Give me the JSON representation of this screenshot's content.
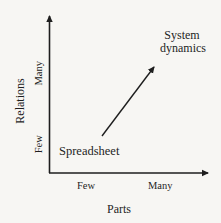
{
  "diagram": {
    "type": "conceptual-2x2-axes",
    "x_axis": {
      "title": "Parts",
      "ticks": [
        "Few",
        "Many"
      ]
    },
    "y_axis": {
      "title": "Relations",
      "ticks": [
        "Few",
        "Many"
      ]
    },
    "points": {
      "start": "Spreadsheet",
      "end_line1": "System",
      "end_line2": "dynamics"
    },
    "arrow": {
      "from": "Spreadsheet",
      "to": "System dynamics"
    }
  },
  "colors": {
    "background": "#f7f6f3",
    "ink": "#1e1e1e"
  }
}
